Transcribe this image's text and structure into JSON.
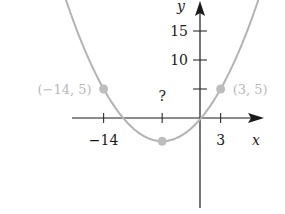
{
  "chart_data": {
    "type": "line",
    "title": "",
    "xlabel": "x",
    "ylabel": "y",
    "xlim": [
      -29,
      13
    ],
    "ylim": [
      -14,
      20
    ],
    "grid": false,
    "x_ticks": [
      {
        "value": -14,
        "label": "−14"
      },
      {
        "value": -5.5,
        "label": "?"
      },
      {
        "value": 3,
        "label": "3"
      }
    ],
    "y_ticks": [
      {
        "value": 5,
        "label": ""
      },
      {
        "value": 10,
        "label": "10"
      },
      {
        "value": 15,
        "label": "15"
      }
    ],
    "series": [
      {
        "name": "parabola",
        "kind": "parabola",
        "vertex": [
          -5.5,
          -4
        ],
        "a": 0.1246,
        "x_range": [
          -22,
          11
        ],
        "color": "#b3b3b3"
      }
    ],
    "points": [
      {
        "x": -14,
        "y": 5,
        "label": "(−14, 5)",
        "label_side": "left"
      },
      {
        "x": 3,
        "y": 5,
        "label": "(3, 5)",
        "label_side": "right"
      },
      {
        "x": -5.5,
        "y": -4,
        "label": "",
        "label_side": "none"
      }
    ],
    "question_label": "?",
    "colors": {
      "axis": "#1a1a1a",
      "curve": "#b3b3b3",
      "point": "#bdbdbd",
      "point_label": "#b8b8b8"
    }
  }
}
